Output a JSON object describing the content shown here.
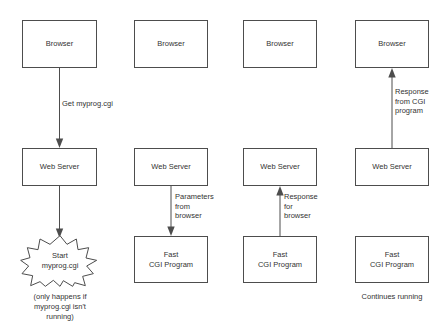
{
  "diagram": {
    "stroke_color": "#4d4d4d",
    "text_color": "#333333",
    "background": "#ffffff",
    "columns": [
      {
        "index": 1,
        "nodes": {
          "browser": "Browser",
          "web_server": "Web Server",
          "process": "Start\nmyprog.cgi"
        },
        "edges": {
          "browser_to_server": "Get myprog.cgi",
          "server_to_process": ""
        },
        "caption": "(only happens if\nmyprog.cgi isn't\nrunning)"
      },
      {
        "index": 2,
        "nodes": {
          "browser": "Browser",
          "web_server": "Web Server",
          "program": "Fast\nCGI Program"
        },
        "edges": {
          "server_to_program": "Parameters\nfrom\nbrowser"
        },
        "caption": ""
      },
      {
        "index": 3,
        "nodes": {
          "browser": "Browser",
          "web_server": "Web Server",
          "program": "Fast\nCGI Program"
        },
        "edges": {
          "program_to_server": "Response\nfor\nbrowser"
        },
        "caption": ""
      },
      {
        "index": 4,
        "nodes": {
          "browser": "Browser",
          "web_server": "Web Server",
          "program": "Fast\nCGI Program"
        },
        "edges": {
          "server_to_browser": "Response\nfrom CGI\nprogram"
        },
        "caption": "Continues running"
      }
    ]
  }
}
